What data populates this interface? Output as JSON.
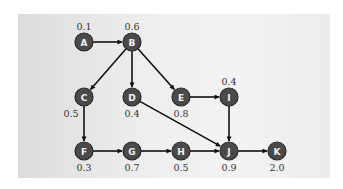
{
  "diagram": {
    "type": "directed-graph",
    "node_color": "#4a4a4a",
    "edge_color": "#111111",
    "background_color": "#eeeeee",
    "nodes": [
      {
        "id": "A",
        "label": "A",
        "value": "0.1",
        "x": 84,
        "y": 42,
        "value_pos": "above"
      },
      {
        "id": "B",
        "label": "B",
        "value": "0.6",
        "x": 132,
        "y": 42,
        "value_pos": "above"
      },
      {
        "id": "C",
        "label": "C",
        "value": "0.5",
        "x": 84,
        "y": 97,
        "value_pos": "below-left"
      },
      {
        "id": "D",
        "label": "D",
        "value": "0.4",
        "x": 132,
        "y": 97,
        "value_pos": "below"
      },
      {
        "id": "E",
        "label": "E",
        "value": "0.8",
        "x": 181,
        "y": 97,
        "value_pos": "below"
      },
      {
        "id": "I",
        "label": "I",
        "value": "0.4",
        "x": 229,
        "y": 97,
        "value_pos": "above"
      },
      {
        "id": "F",
        "label": "F",
        "value": "0.3",
        "x": 84,
        "y": 151,
        "value_pos": "below"
      },
      {
        "id": "G",
        "label": "G",
        "value": "0.7",
        "x": 132,
        "y": 151,
        "value_pos": "below"
      },
      {
        "id": "H",
        "label": "H",
        "value": "0.5",
        "x": 181,
        "y": 151,
        "value_pos": "below"
      },
      {
        "id": "J",
        "label": "J",
        "value": "0.9",
        "x": 229,
        "y": 151,
        "value_pos": "below"
      },
      {
        "id": "K",
        "label": "K",
        "value": "2.0",
        "x": 277,
        "y": 151,
        "value_pos": "below"
      }
    ],
    "edges": [
      {
        "from": "A",
        "to": "B"
      },
      {
        "from": "B",
        "to": "C"
      },
      {
        "from": "B",
        "to": "D"
      },
      {
        "from": "B",
        "to": "E"
      },
      {
        "from": "E",
        "to": "I"
      },
      {
        "from": "D",
        "to": "J"
      },
      {
        "from": "I",
        "to": "J"
      },
      {
        "from": "C",
        "to": "F"
      },
      {
        "from": "F",
        "to": "G"
      },
      {
        "from": "G",
        "to": "H"
      },
      {
        "from": "H",
        "to": "J"
      },
      {
        "from": "J",
        "to": "K"
      }
    ]
  }
}
